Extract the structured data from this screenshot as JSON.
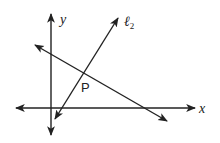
{
  "diagram": {
    "type": "coordinate-geometry",
    "axes": {
      "x_label": "x",
      "y_label": "y"
    },
    "lines": [
      {
        "id": "l2",
        "label": "ℓ",
        "subscript": "2",
        "from": [
          118,
          18
        ],
        "to": [
          55,
          118
        ]
      },
      {
        "id": "l1",
        "label": "",
        "from": [
          35,
          45
        ],
        "to": [
          167,
          121
        ]
      }
    ],
    "points": [
      {
        "id": "P",
        "label": "P",
        "at": [
          82,
          72
        ]
      }
    ],
    "colors": {
      "stroke": "#222222",
      "background": "#ffffff"
    }
  }
}
